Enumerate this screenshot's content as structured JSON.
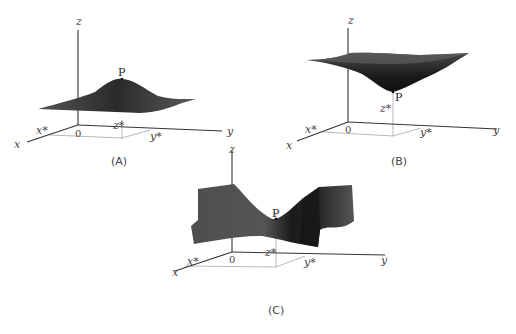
{
  "figure": {
    "panels": [
      {
        "id": "A",
        "caption": "(A)",
        "surface_type": "maximum (hill)",
        "point_label": "P",
        "axis_labels": {
          "x": "x",
          "y": "y",
          "z": "z",
          "origin": "0",
          "x_star": "x*",
          "y_star": "y*",
          "z_star": "z*"
        }
      },
      {
        "id": "B",
        "caption": "(B)",
        "surface_type": "minimum (bowl)",
        "point_label": "P",
        "axis_labels": {
          "x": "x",
          "y": "y",
          "z": "z",
          "origin": "0",
          "x_star": "x*",
          "y_star": "y*",
          "z_star": "z*"
        }
      },
      {
        "id": "C",
        "caption": "(C)",
        "surface_type": "saddle point",
        "point_label": "P",
        "axis_labels": {
          "x": "x",
          "y": "y",
          "z": "z",
          "origin": "0",
          "x_star": "x*",
          "y_star": "y*",
          "z_star": "z*"
        }
      }
    ],
    "colors": {
      "surface_dark": "#1e1e1e",
      "surface_mid": "#4a4a4a",
      "surface_light": "#6e6e6e",
      "axis": "#333333",
      "guide": "#999999"
    }
  }
}
